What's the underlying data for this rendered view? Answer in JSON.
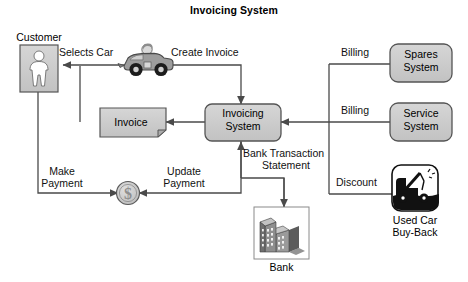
{
  "title": "Invoicing System",
  "colors": {
    "background": "#ffffff",
    "line": "#4a4a4a",
    "node_fill": "#c9c9c9",
    "node_fill_light": "#d0d0d0",
    "node_stroke": "#555555",
    "text": "#111111",
    "icon_dark": "#111111"
  },
  "nodes": [
    {
      "id": "customer",
      "kind": "actor-icon",
      "label": "Customer",
      "label_pos": "above"
    },
    {
      "id": "car",
      "kind": "car-icon",
      "label": "",
      "label_pos": "none"
    },
    {
      "id": "invoice",
      "kind": "document",
      "label": "Invoice",
      "label_pos": "inside"
    },
    {
      "id": "invoicing",
      "kind": "rounded-box",
      "label": "Invoicing\nSystem",
      "label_line1": "Invoicing",
      "label_line2": "System",
      "label_pos": "inside"
    },
    {
      "id": "spares",
      "kind": "rounded-box",
      "label_line1": "Spares",
      "label_line2": "System",
      "label_pos": "inside"
    },
    {
      "id": "service",
      "kind": "rounded-box",
      "label_line1": "Service",
      "label_line2": "System",
      "label_pos": "inside"
    },
    {
      "id": "usedcar",
      "kind": "truck-icon",
      "label_line1": "Used Car",
      "label_line2": "Buy-Back",
      "label_pos": "below"
    },
    {
      "id": "bank",
      "kind": "bank-icon",
      "label": "Bank",
      "label_pos": "below"
    },
    {
      "id": "coin",
      "kind": "coin-icon",
      "label": "",
      "label_pos": "none"
    }
  ],
  "edges": [
    {
      "id": "selects-car",
      "label": "Selects Car",
      "from": "car",
      "to": "customer"
    },
    {
      "id": "create-invoice",
      "label": "Create Invoice",
      "from": "car",
      "to": "invoicing"
    },
    {
      "id": "invoice-to-customer",
      "label": "",
      "from": "invoicing",
      "to": "invoice"
    },
    {
      "id": "billing-spares",
      "label": "Billing",
      "from": "spares",
      "to": "invoicing"
    },
    {
      "id": "billing-service",
      "label": "Billing",
      "from": "service",
      "to": "invoicing"
    },
    {
      "id": "discount",
      "label": "Discount",
      "from": "usedcar",
      "to": "invoicing"
    },
    {
      "id": "make-payment",
      "label_line1": "Make",
      "label_line2": "Payment",
      "from": "customer",
      "to": "coin"
    },
    {
      "id": "update-payment",
      "label_line1": "Update",
      "label_line2": "Payment",
      "from": "invoicing",
      "to": "coin"
    },
    {
      "id": "bank-transaction",
      "label_line1": "Bank Transaction",
      "label_line2": "Statement",
      "from": "bank",
      "to": "invoicing"
    }
  ],
  "labels": {
    "customer": "Customer",
    "selects_car": "Selects Car",
    "create_invoice": "Create Invoice",
    "invoice": "Invoice",
    "invoicing_l1": "Invoicing",
    "invoicing_l2": "System",
    "spares_l1": "Spares",
    "spares_l2": "System",
    "service_l1": "Service",
    "service_l2": "System",
    "billing_top": "Billing",
    "billing_mid": "Billing",
    "discount": "Discount",
    "usedcar_l1": "Used Car",
    "usedcar_l2": "Buy-Back",
    "make_l1": "Make",
    "make_l2": "Payment",
    "update_l1": "Update",
    "update_l2": "Payment",
    "bts_l1": "Bank Transaction",
    "bts_l2": "Statement",
    "bank": "Bank"
  }
}
